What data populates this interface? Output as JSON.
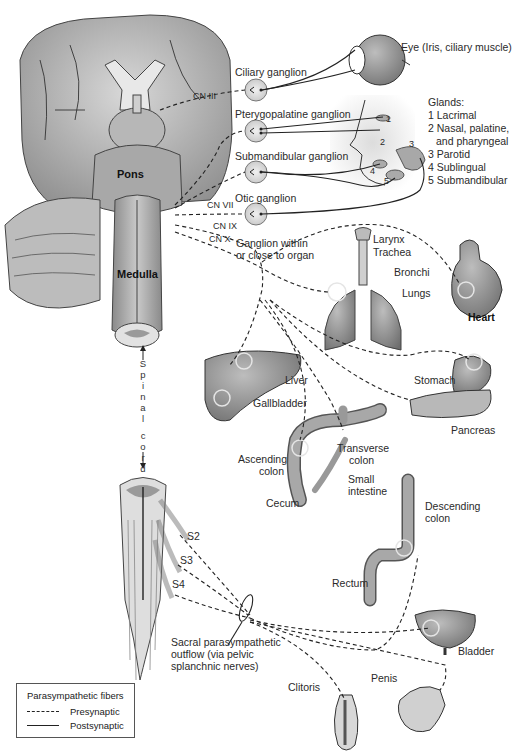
{
  "figure": {
    "type": "anatomical-diagram"
  },
  "brain_labels": {
    "pons": "Pons",
    "medulla": "Medulla",
    "spinal_cord": [
      "S",
      "p",
      "i",
      "n",
      "a",
      "l",
      "c",
      "o",
      "r",
      "d"
    ],
    "cranial_nerves": [
      "CN III",
      "CN VII",
      "CN IX",
      "CN X"
    ]
  },
  "ganglia": [
    {
      "name": "Ciliary ganglion"
    },
    {
      "name": "Pterygopalatine ganglion"
    },
    {
      "name": "Submandibular ganglion"
    },
    {
      "name": "Otic ganglion"
    }
  ],
  "targets": {
    "eye": "Eye (Iris, ciliary muscle)",
    "glands_title": "Glands:",
    "glands": [
      {
        "num": "1",
        "name": "Lacrimal"
      },
      {
        "num": "2",
        "name": "Nasal, palatine,",
        "line2": "and pharyngeal"
      },
      {
        "num": "3",
        "name": "Parotid"
      },
      {
        "num": "4",
        "name": "Sublingual"
      },
      {
        "num": "5",
        "name": "Submandibular"
      }
    ],
    "face_numbers": [
      "1",
      "2",
      "3",
      "4",
      "5"
    ],
    "ganglion_near_organ": [
      "Ganglion within",
      "or close to organ"
    ],
    "larynx": "Larynx",
    "trachea": "Trachea",
    "bronchi": "Bronchi",
    "lungs": "Lungs",
    "heart": "Heart",
    "liver": "Liver",
    "gallbladder": "Gallbladder",
    "stomach": "Stomach",
    "pancreas": "Pancreas",
    "ascending_colon": [
      "Ascending",
      "colon"
    ],
    "transverse_colon": [
      "Transverse",
      "colon"
    ],
    "small_intestine": [
      "Small",
      "intestine"
    ],
    "cecum": "Cecum",
    "descending_colon": [
      "Descending",
      "colon"
    ],
    "rectum": "Rectum",
    "bladder": "Bladder",
    "clitoris": "Clitoris",
    "penis": "Penis"
  },
  "sacral": {
    "levels": [
      "S2",
      "S3",
      "S4"
    ],
    "outflow": [
      "Sacral parasympathetic",
      "outflow (via pelvic",
      "splanchnic nerves)"
    ]
  },
  "legend": {
    "title": "Parasympathetic fibers",
    "items": [
      {
        "style": "dashed",
        "label": "Presynaptic"
      },
      {
        "style": "solid",
        "label": "Postsynaptic"
      }
    ]
  },
  "colors": {
    "tissue_dark": "#7a7a7a",
    "tissue_mid": "#a9a9a9",
    "tissue_light": "#d6d6d6",
    "line": "#1a1a1a"
  }
}
